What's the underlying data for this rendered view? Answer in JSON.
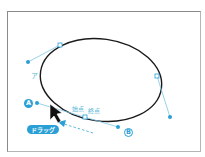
{
  "diagram": {
    "type": "bezier-ellipse-path-editing",
    "labels": {
      "point_a": "A",
      "point_b": "B",
      "segment_label": "ア",
      "start_point": "始点",
      "end_point": "終点",
      "drag_badge": "ドラッグ"
    },
    "colors": {
      "path_stroke": "#1a1a1a",
      "handle": "#2a9fd6",
      "handle_line": "#7cc7e6",
      "label_text": "#5bb8d8",
      "frame_border": "#8a8a8a"
    },
    "anchors": [
      {
        "name": "top-left-anchor",
        "x": 60,
        "y": 45
      },
      {
        "name": "right-anchor",
        "x": 157,
        "y": 76
      },
      {
        "name": "bottom-anchor",
        "x": 85,
        "y": 117
      }
    ],
    "handles": [
      {
        "name": "top-left-handle",
        "x": 28,
        "y": 62
      },
      {
        "name": "right-handle",
        "x": 170,
        "y": 117
      },
      {
        "name": "bottom-handle-a",
        "x": 37,
        "y": 103
      },
      {
        "name": "bottom-handle-b",
        "x": 118,
        "y": 127
      }
    ]
  }
}
